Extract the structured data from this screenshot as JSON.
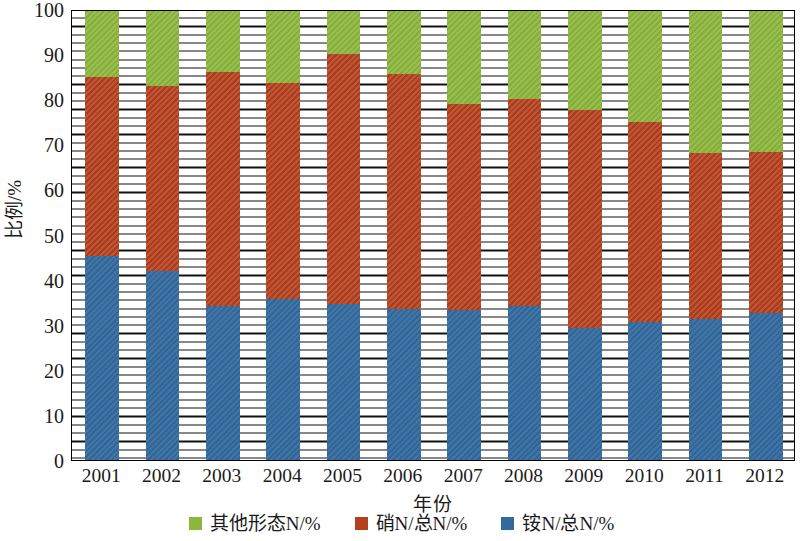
{
  "chart_data": {
    "type": "bar",
    "subtype": "stacked-100-percent",
    "title": "",
    "xlabel": "年份",
    "ylabel": "比例/%",
    "categories": [
      "2001",
      "2002",
      "2003",
      "2004",
      "2005",
      "2006",
      "2007",
      "2008",
      "2009",
      "2010",
      "2011",
      "2012"
    ],
    "series": [
      {
        "name": "铵N/总N/%",
        "color": "#336a9e",
        "values": [
          45.3,
          42.0,
          34.1,
          35.7,
          34.6,
          33.5,
          33.3,
          34.1,
          29.3,
          30.5,
          31.3,
          32.5
        ]
      },
      {
        "name": "硝N/总N/%",
        "color": "#b5401d",
        "values": [
          39.7,
          41.0,
          51.9,
          48.0,
          55.4,
          52.0,
          45.7,
          45.9,
          48.2,
          44.5,
          36.7,
          35.7
        ]
      },
      {
        "name": "其他形态N/%",
        "color": "#8cb63c",
        "values": [
          15.0,
          17.0,
          14.0,
          16.3,
          10.0,
          14.5,
          21.0,
          20.0,
          22.5,
          25.0,
          32.0,
          31.8
        ]
      }
    ],
    "cumulative_tops": {
      "ammonium": [
        45.3,
        42.0,
        34.1,
        35.7,
        34.6,
        33.5,
        33.3,
        34.1,
        29.3,
        30.5,
        31.3,
        32.5
      ],
      "nitrate_plus_ammonium": [
        85.0,
        83.0,
        86.0,
        83.7,
        90.0,
        85.5,
        79.0,
        80.0,
        77.5,
        75.0,
        68.0,
        68.2
      ],
      "total": [
        100,
        100,
        100,
        100,
        100,
        100,
        100,
        100,
        100,
        100,
        100,
        100
      ]
    },
    "ylim": [
      0,
      100
    ],
    "yticks": [
      0,
      10,
      20,
      30,
      40,
      50,
      60,
      70,
      80,
      90,
      100
    ],
    "ytick_labels": [
      "0",
      "10",
      "20",
      "30",
      "40",
      "50",
      "60",
      "70",
      "80",
      "90",
      "100"
    ],
    "grid": "horizontal-minor-dense",
    "legend_position": "bottom-center",
    "legend": [
      {
        "label": "其他形态N/%",
        "color": "#8cb63c"
      },
      {
        "label": "硝N/总N/%",
        "color": "#b5401d"
      },
      {
        "label": "铵N/总N/%",
        "color": "#336a9e"
      }
    ]
  }
}
